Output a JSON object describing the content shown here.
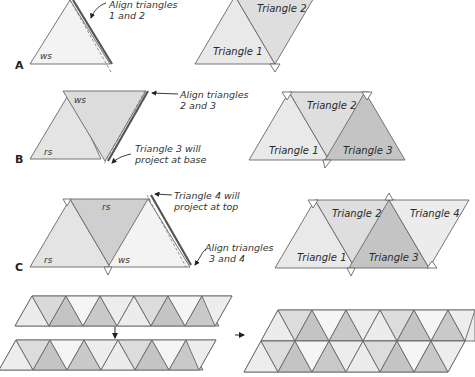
{
  "figure": {
    "steps": [
      {
        "id": "A",
        "label": "A",
        "left": {
          "triangle_label": "ws",
          "callout": [
            "Align triangles",
            "1 and 2"
          ]
        },
        "right": {
          "triangles": [
            "Triangle 1",
            "Triangle 2"
          ]
        }
      },
      {
        "id": "B",
        "label": "B",
        "left": {
          "labels": [
            "ws",
            "rs"
          ],
          "callouts": [
            [
              "Align triangles",
              "2 and 3"
            ],
            [
              "Triangle 3 will",
              "project at base"
            ]
          ]
        },
        "right": {
          "triangles": [
            "Triangle 1",
            "Triangle 2",
            "Triangle 3"
          ]
        }
      },
      {
        "id": "C",
        "label": "C",
        "left": {
          "labels": [
            "rs",
            "rs",
            "ws"
          ],
          "callouts": [
            [
              "Triangle 4 will",
              "project at top"
            ],
            [
              "Align triangles",
              "3 and 4"
            ]
          ]
        },
        "right": {
          "triangles": [
            "Triangle 1",
            "Triangle 2",
            "Triangle 3",
            "Triangle 4"
          ]
        }
      }
    ],
    "bottom": {
      "description": "Two strips of alternating triangles joined into a larger panel"
    },
    "colors": {
      "light": "#ececec",
      "mid": "#dcdcdc",
      "dark": "#bdbdbd",
      "white": "#f7f7f7",
      "edge": "#666666",
      "thick_edge": "#555555"
    }
  }
}
